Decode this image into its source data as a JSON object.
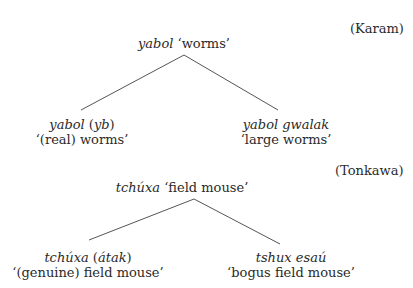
{
  "diagrams": [
    {
      "language_label": "(Karam)",
      "root": {
        "term": "yabol",
        "gloss": "‘worms’"
      },
      "children": [
        {
          "term": "yabol",
          "modifier": "yb",
          "open_paren": "(",
          "close_paren": ")",
          "gloss": "‘(real) worms’"
        },
        {
          "term": "yabol gwalak",
          "gloss": "‘large worms’"
        }
      ]
    },
    {
      "language_label": "(Tonkawa)",
      "root": {
        "term": "tchúxa",
        "gloss": "‘field mouse’"
      },
      "children": [
        {
          "term": "tchúxa",
          "modifier": "átak",
          "open_paren": "(",
          "close_paren": ")",
          "gloss": "‘(genuine) field mouse’"
        },
        {
          "term": "tshux esaú",
          "gloss": "‘bogus field mouse’"
        }
      ]
    }
  ],
  "colors": {
    "text": "#2a2a2a",
    "line": "#555555",
    "background": "#ffffff"
  }
}
